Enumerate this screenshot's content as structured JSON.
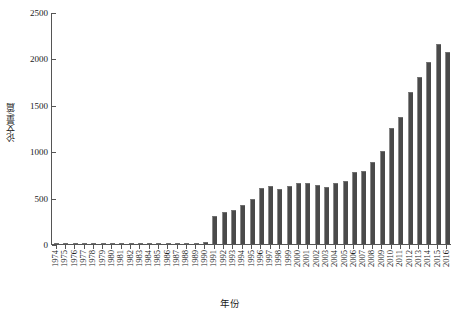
{
  "chart_data": {
    "type": "bar",
    "title": "",
    "xlabel": "年份",
    "ylabel": "论文量/篇",
    "ylim": [
      0,
      2500
    ],
    "yticks": [
      0,
      500,
      1000,
      1500,
      2000,
      2500
    ],
    "ytick_labels": [
      "0",
      "500",
      "1000",
      "1500",
      "2000",
      "2500"
    ],
    "grid": false,
    "legend": null,
    "bar_color": "#4a4a4a",
    "categories": [
      "1974",
      "1975",
      "1976",
      "1977",
      "1978",
      "1979",
      "1980",
      "1981",
      "1982",
      "1983",
      "1984",
      "1985",
      "1986",
      "1987",
      "1988",
      "1989",
      "1990",
      "1991",
      "1992",
      "1993",
      "1994",
      "1995",
      "1996",
      "1997",
      "1998",
      "1999",
      "2000",
      "2001",
      "2002",
      "2003",
      "2004",
      "2005",
      "2006",
      "2007",
      "2008",
      "2009",
      "2010",
      "2011",
      "2012",
      "2013",
      "2014",
      "2015",
      "2016"
    ],
    "values": [
      2,
      2,
      3,
      3,
      8,
      4,
      10,
      8,
      8,
      7,
      10,
      12,
      12,
      12,
      14,
      16,
      25,
      300,
      345,
      370,
      425,
      480,
      600,
      625,
      595,
      620,
      660,
      655,
      640,
      615,
      660,
      680,
      780,
      790,
      880,
      1000,
      1250,
      1370,
      1640,
      1800,
      1960,
      2150,
      2070
    ]
  }
}
